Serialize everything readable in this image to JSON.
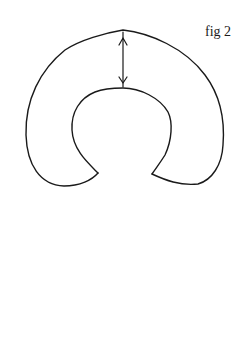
{
  "figure": {
    "label": "fig 2",
    "stroke_color": "#1a1a1a",
    "background_color": "#ffffff",
    "shape": "horseshoe",
    "measurement_arrow": {
      "type": "double-headed",
      "orientation": "vertical",
      "from": "outer-top-edge",
      "to": "inner-top-edge"
    }
  }
}
